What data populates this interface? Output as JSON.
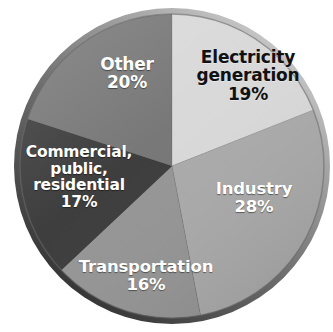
{
  "figure": {
    "background_color": "#ffffff",
    "style": "grayscale button-style pie chart with beveled rim and drop shadow",
    "center": {
      "x": 172,
      "y": 166
    },
    "radius": 152
  },
  "chart_data": {
    "type": "pie",
    "title": "",
    "subtitle": "",
    "xlabel": "",
    "ylabel": "",
    "legend_position": "none",
    "grid": false,
    "labels_inside_slices": true,
    "start_angle_deg": 0,
    "direction": "clockwise",
    "categories": [
      "Electricity generation",
      "Industry",
      "Transportation",
      "Commercial, public, residential",
      "Other"
    ],
    "values": [
      19,
      28,
      16,
      17,
      20
    ],
    "value_suffix": "%",
    "total": 100,
    "slices": [
      {
        "id": "electricity",
        "label": "Electricity generation",
        "label_lines": [
          "Electricity",
          "generation"
        ],
        "value": 19,
        "value_text": "19%",
        "color": "#d8d8d8",
        "text_color": "#111111",
        "start_angle_deg": 0,
        "end_angle_deg": 68.4
      },
      {
        "id": "industry",
        "label": "Industry",
        "label_lines": [
          "Industry"
        ],
        "value": 28,
        "value_text": "28%",
        "color": "#a9a9a9",
        "text_color": "#ffffff",
        "start_angle_deg": 68.4,
        "end_angle_deg": 169.2
      },
      {
        "id": "transportation",
        "label": "Transportation",
        "label_lines": [
          "Transportation"
        ],
        "value": 16,
        "value_text": "16%",
        "color": "#949494",
        "text_color": "#ffffff",
        "start_angle_deg": 169.2,
        "end_angle_deg": 226.8
      },
      {
        "id": "commercial",
        "label": "Commercial, public, residential",
        "label_lines": [
          "Commercial,",
          "public,",
          "residential"
        ],
        "value": 17,
        "value_text": "17%",
        "color": "#3a3a3a",
        "text_color": "#ffffff",
        "start_angle_deg": 226.8,
        "end_angle_deg": 288.0
      },
      {
        "id": "other",
        "label": "Other",
        "label_lines": [
          "Other"
        ],
        "value": 20,
        "value_text": "20%",
        "color": "#757575",
        "text_color": "#ffffff",
        "start_angle_deg": 288.0,
        "end_angle_deg": 360.0
      }
    ],
    "colors": {
      "electricity": "#d8d8d8",
      "industry": "#a9a9a9",
      "transportation": "#949494",
      "commercial": "#3a3a3a",
      "other": "#757575",
      "rim": "#5a5a5a",
      "shadow": "#bdbdbd"
    }
  }
}
